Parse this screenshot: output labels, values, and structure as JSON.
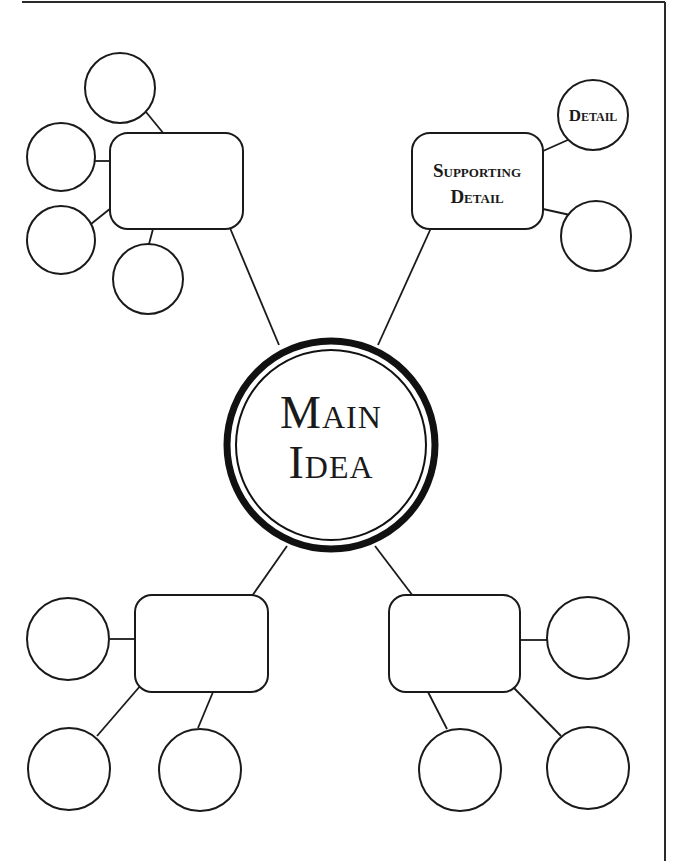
{
  "diagram": {
    "type": "main-idea-web",
    "central_node": {
      "label_lines": [
        "Main",
        "Idea"
      ]
    },
    "branches": [
      {
        "id": "top-left",
        "box_label_lines": [],
        "detail_circles": [
          {
            "label": ""
          },
          {
            "label": ""
          },
          {
            "label": ""
          },
          {
            "label": ""
          }
        ]
      },
      {
        "id": "top-right",
        "box_label_lines": [
          "Supporting",
          "Detail"
        ],
        "detail_circles": [
          {
            "label": "Detail"
          },
          {
            "label": ""
          }
        ]
      },
      {
        "id": "bottom-left",
        "box_label_lines": [],
        "detail_circles": [
          {
            "label": ""
          },
          {
            "label": ""
          },
          {
            "label": ""
          }
        ]
      },
      {
        "id": "bottom-right",
        "box_label_lines": [],
        "detail_circles": [
          {
            "label": ""
          },
          {
            "label": ""
          },
          {
            "label": ""
          }
        ]
      }
    ]
  }
}
